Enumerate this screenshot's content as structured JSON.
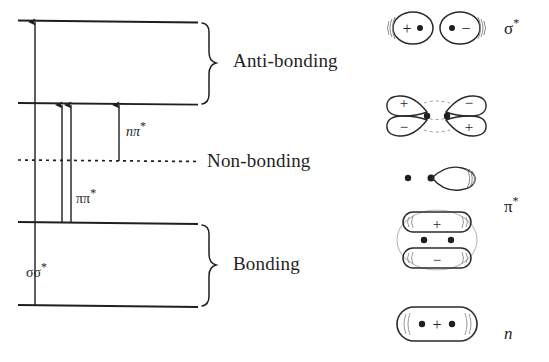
{
  "figure": {
    "ink_color": "#1f1f1f",
    "background_color": "#ffffff"
  },
  "energy_levels": [
    {
      "id": "sigma-star",
      "name": "sigma-antibonding-level",
      "y": 20,
      "x1": 18,
      "x2": 198,
      "style": "solid"
    },
    {
      "id": "pi-star",
      "name": "pi-antibonding-level",
      "y": 103,
      "x1": 18,
      "x2": 198,
      "style": "solid"
    },
    {
      "id": "non-bonding",
      "name": "non-bonding-level",
      "y": 160,
      "x1": 18,
      "x2": 198,
      "style": "dotted"
    },
    {
      "id": "pi",
      "name": "pi-bonding-level",
      "y": 222,
      "x1": 18,
      "x2": 198,
      "style": "solid"
    },
    {
      "id": "sigma",
      "name": "sigma-bonding-level",
      "y": 305,
      "x1": 18,
      "x2": 198,
      "style": "solid"
    }
  ],
  "categories": [
    {
      "key": "anti_bonding",
      "label": "Anti-bonding",
      "brace_top": 22,
      "brace_bottom": 104,
      "label_x": 233,
      "label_y": 61
    },
    {
      "key": "non_bonding",
      "label": "Non-bonding",
      "brace_top": 0,
      "brace_bottom": 0,
      "label_x": 207,
      "label_y": 161
    },
    {
      "key": "bonding",
      "label": "Bonding",
      "brace_top": 224,
      "brace_bottom": 307,
      "label_x": 233,
      "label_y": 264
    }
  ],
  "transitions": [
    {
      "key": "sigma_sigma_star",
      "label": "σσ",
      "star": "*",
      "label_x": 26,
      "label_y": 270,
      "from_level": "sigma",
      "to_level": "sigma-star",
      "arrow_x": 35,
      "y_from": 305,
      "y_to": 20
    },
    {
      "key": "pi_pi_star_a",
      "label": "",
      "star": "",
      "from_level": "pi",
      "to_level": "pi-star",
      "arrow_x": 64,
      "y_from": 222,
      "y_to": 103
    },
    {
      "key": "pi_pi_star_b",
      "label": "ππ",
      "star": "*",
      "label_x": 75,
      "label_y": 196,
      "from_level": "pi",
      "to_level": "pi-star",
      "arrow_x": 73,
      "y_from": 222,
      "y_to": 103
    },
    {
      "key": "n_pi_star",
      "label": "nπ",
      "star": "*",
      "label_x": 128,
      "label_y": 129,
      "from_level": "non-bonding",
      "to_level": "pi-star",
      "arrow_x": 119,
      "y_from": 160,
      "y_to": 103
    }
  ],
  "orbitals": [
    {
      "key": "sigma_star",
      "type": "sigma-antibonding",
      "symbol": "σ",
      "symbol_star": "*",
      "symbol_x": 124,
      "symbol_y": 16,
      "row_top": 2,
      "row_height": 52,
      "signs": [
        "+",
        "−"
      ],
      "nuclei": 2,
      "description": "two separate oval lobes, left marked plus, right marked minus"
    },
    {
      "key": "pi_star",
      "type": "pi-antibonding",
      "symbol": "π",
      "symbol_star": "*",
      "symbol_x": 124,
      "symbol_y": 110,
      "row_top": 86,
      "row_height": 62,
      "signs": [
        "+",
        "−",
        "−",
        "+"
      ],
      "nuclei": 2,
      "description": "four lobes, top-left plus, top-right minus, bottom-left minus, bottom-right plus"
    },
    {
      "key": "n",
      "type": "non-bonding",
      "symbol": "n",
      "symbol_star": "",
      "symbol_x": 124,
      "symbol_y": 168,
      "row_top": 158,
      "row_height": 40,
      "signs": [],
      "nuclei": 2,
      "description": "single teardrop lone-pair lobe to the right of two nuclei"
    },
    {
      "key": "pi",
      "type": "pi-bonding",
      "symbol": "π",
      "symbol_star": "",
      "symbol_x": 124,
      "symbol_y": 232,
      "row_top": 206,
      "row_height": 68,
      "signs": [
        "+",
        "−"
      ],
      "nuclei": 2,
      "description": "top elongated lobe plus, bottom elongated lobe minus, two nuclei between"
    },
    {
      "key": "sigma",
      "type": "sigma-bonding",
      "symbol": "σ",
      "symbol_star": "",
      "symbol_x": 124,
      "symbol_y": 320,
      "row_top": 300,
      "row_height": 50,
      "signs": [
        "+"
      ],
      "nuclei": 2,
      "description": "single enclosing lobe containing both nuclei with a plus sign"
    }
  ]
}
